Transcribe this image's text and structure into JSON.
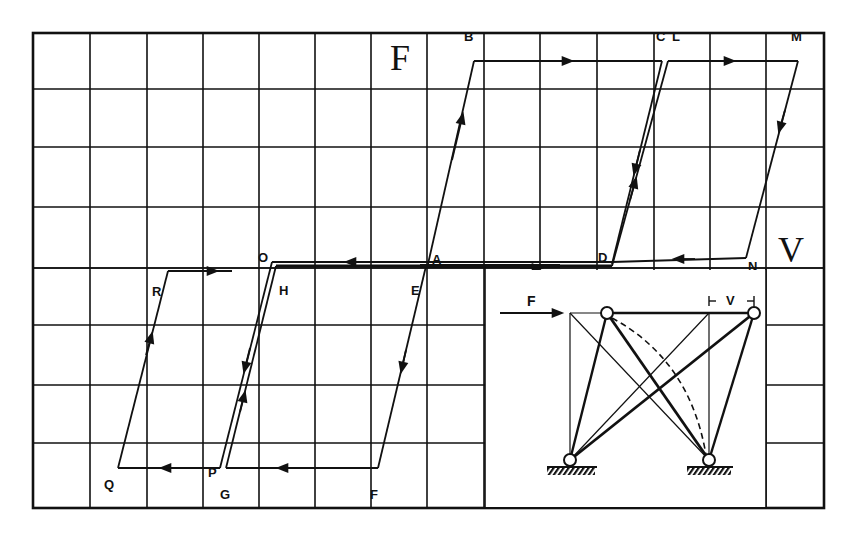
{
  "figure": {
    "type": "hysteresis-diagram",
    "axis_labels": {
      "vertical": "F",
      "horizontal": "V"
    },
    "grid": {
      "columns": 14,
      "rows": 8,
      "x_lines": [
        33,
        90,
        147,
        203,
        259,
        315,
        371,
        427,
        484,
        540,
        597,
        654,
        710,
        766,
        824
      ],
      "y_lines": [
        33,
        89,
        147,
        207,
        268,
        325,
        385,
        443,
        508
      ]
    },
    "points": {
      "A": {
        "label": "A",
        "x": 430,
        "y": 262
      },
      "B": {
        "label": "B",
        "x": 474,
        "y": 61
      },
      "C": {
        "label": "C",
        "x": 660,
        "y": 61
      },
      "D": {
        "label": "D",
        "x": 612,
        "y": 262
      },
      "E": {
        "label": "E",
        "x": 425,
        "y": 267
      },
      "F": {
        "label": "F",
        "x": 378,
        "y": 469
      },
      "G": {
        "label": "G",
        "x": 226,
        "y": 469
      },
      "H": {
        "label": "H",
        "x": 275,
        "y": 267
      },
      "I": {
        "label": "I",
        "x": 610,
        "y": 267
      },
      "L": {
        "label": "L",
        "x": 670,
        "y": 61
      },
      "M": {
        "label": "M",
        "x": 797,
        "y": 61
      },
      "N": {
        "label": "N",
        "x": 746,
        "y": 257
      },
      "O": {
        "label": "O",
        "x": 272,
        "y": 262
      },
      "P": {
        "label": "P",
        "x": 220,
        "y": 469
      },
      "Q": {
        "label": "Q",
        "x": 118,
        "y": 467
      },
      "R": {
        "label": "R",
        "x": 168,
        "y": 272
      }
    },
    "paths": [
      {
        "name": "A-B",
        "from": "A",
        "to": "B"
      },
      {
        "name": "B-C",
        "from": "B",
        "to": "C"
      },
      {
        "name": "C-D",
        "from": "C",
        "to": "D"
      },
      {
        "name": "D-O",
        "from": "D",
        "to": "O"
      },
      {
        "name": "O-P",
        "from": "O",
        "to": "P"
      },
      {
        "name": "P-Q",
        "from": "P",
        "to": "Q"
      },
      {
        "name": "Q-R",
        "from": "Q",
        "to": "R"
      },
      {
        "name": "E-F",
        "from": "E",
        "to": "F"
      },
      {
        "name": "F-G",
        "from": "F",
        "to": "G"
      },
      {
        "name": "G-H",
        "from": "G",
        "to": "H"
      },
      {
        "name": "H-I",
        "from": "H",
        "to": "I"
      },
      {
        "name": "I-L",
        "from": "I",
        "to": "L"
      },
      {
        "name": "L-M",
        "from": "L",
        "to": "M"
      },
      {
        "name": "M-N",
        "from": "M",
        "to": "N"
      },
      {
        "name": "N-I",
        "from": "N",
        "to": "I"
      }
    ],
    "inset": {
      "force_label": "F",
      "displacement_label": "V",
      "displacement_marker": "⊢ V ⊣"
    }
  }
}
